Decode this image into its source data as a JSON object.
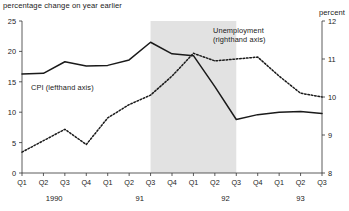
{
  "chart_data": {
    "type": "line",
    "title": "",
    "top_left_caption": "percentage change on year earlier",
    "top_right_caption": "percent",
    "x": [
      "Q1",
      "Q2",
      "Q3",
      "Q4",
      "Q1",
      "Q2",
      "Q3",
      "Q4",
      "Q1",
      "Q2",
      "Q3",
      "Q4",
      "Q1",
      "Q2",
      "Q3"
    ],
    "year_groups": [
      {
        "label": "1990",
        "start_index": 0,
        "end_index": 3
      },
      {
        "label": "91",
        "start_index": 4,
        "end_index": 7
      },
      {
        "label": "92",
        "start_index": 8,
        "end_index": 11
      },
      {
        "label": "93",
        "start_index": 12,
        "end_index": 14
      }
    ],
    "xlabel": "",
    "grid": false,
    "legend_position": "inline-annotation",
    "left_axis": {
      "label": "percentage change on year earlier",
      "ticks": [
        0,
        5,
        10,
        15,
        20,
        25
      ],
      "ylim": [
        0,
        25
      ]
    },
    "right_axis": {
      "label": "percent",
      "ticks": [
        8,
        9,
        10,
        11,
        12
      ],
      "ylim": [
        8,
        12
      ]
    },
    "series": [
      {
        "name": "CPI (lefthand axis)",
        "axis": "left",
        "style": "solid",
        "color": "#1a1a1a",
        "values": [
          16.3,
          16.4,
          18.3,
          17.6,
          17.7,
          18.6,
          21.5,
          19.6,
          19.3,
          14.2,
          8.8,
          9.6,
          10.0,
          10.1,
          9.8
        ]
      },
      {
        "name": "Unemployment (righthand axis)",
        "axis": "right",
        "style": "dotted",
        "color": "#1a1a1a",
        "values": [
          8.55,
          8.85,
          9.15,
          8.75,
          9.45,
          9.8,
          10.05,
          10.55,
          11.15,
          10.95,
          11.0,
          11.05,
          10.55,
          10.1,
          10.0
        ]
      }
    ],
    "shaded_region": {
      "label": "",
      "from_index": 6,
      "to_index": 10,
      "color": "#e2e2e2"
    },
    "annotations": [
      {
        "name": "cpi-label",
        "text": "CPI (lefthand axis)"
      },
      {
        "name": "unemployment-label-line1",
        "text": "Unemployment"
      },
      {
        "name": "unemployment-label-line2",
        "text": "(righthand axis)"
      }
    ]
  }
}
